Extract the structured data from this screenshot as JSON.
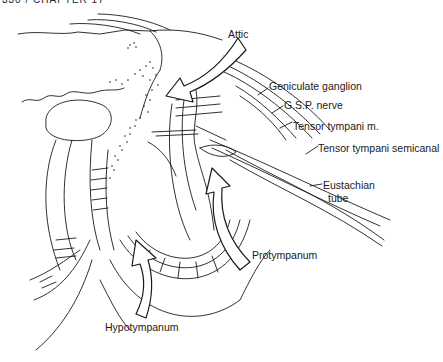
{
  "figure": {
    "header_fragment": "330 / CHAPTER 17",
    "labels": {
      "attic": "Attic",
      "geniculate": "Geniculate ganglion",
      "gsp": "G.S.P. nerve",
      "tensor_m": "Tensor tympani m.",
      "tensor_semicanal": "Tensor tympani semicanal",
      "eustachian_1": "Eustachian",
      "eustachian_2": "tube",
      "protympanum": "Protympanum",
      "hypotympanum": "Hypotympanum"
    },
    "arrows": [
      {
        "name": "attic-arrow",
        "direction": "down-left"
      },
      {
        "name": "protympanum-arrow",
        "direction": "up"
      },
      {
        "name": "hypotympanum-arrow",
        "direction": "up"
      }
    ],
    "colors": {
      "line": "#1a1a1a",
      "background": "#ffffff"
    }
  }
}
